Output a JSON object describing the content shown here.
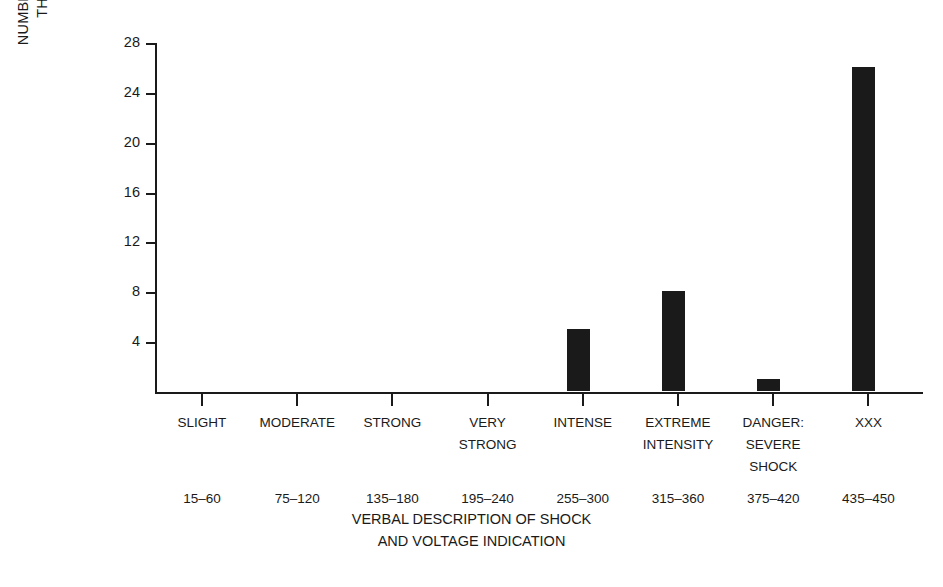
{
  "chart_data": {
    "type": "bar",
    "title": "",
    "xlabel": "VERBAL DESCRIPTION OF SHOCK AND VOLTAGE INDICATION",
    "xlabel_lines": [
      "VERBAL DESCRIPTION OF SHOCK",
      "AND VOLTAGE INDICATION"
    ],
    "ylabel": "NUMBER OF SUBJECTS FOR WHOM THIS WAS MAXIMUM SHOCK",
    "ylabel_lines": [
      "NUMBER OF SUBJECTS FOR WHOM",
      "THIS WAS MAXIMUM SHOCK"
    ],
    "categories": [
      "SLIGHT",
      "MODERATE",
      "STRONG",
      "VERY STRONG",
      "INTENSE",
      "EXTREME INTENSITY",
      "DANGER: SEVERE SHOCK",
      "XXX"
    ],
    "category_lines": [
      [
        "SLIGHT"
      ],
      [
        "MODERATE"
      ],
      [
        "STRONG"
      ],
      [
        "VERY",
        "STRONG"
      ],
      [
        "INTENSE"
      ],
      [
        "EXTREME",
        "INTENSITY"
      ],
      [
        "DANGER:",
        "SEVERE",
        "SHOCK"
      ],
      [
        "XXX"
      ]
    ],
    "voltage_labels": [
      "15–60",
      "75–120",
      "135–180",
      "195–240",
      "255–300",
      "315–360",
      "375–420",
      "435–450"
    ],
    "values": [
      0,
      0,
      0,
      0,
      5,
      8,
      1,
      26
    ],
    "ylim": [
      0,
      28
    ],
    "yticks": [
      4,
      8,
      12,
      16,
      20,
      24,
      28
    ],
    "ytick_labels": [
      "4",
      "8",
      "12",
      "16",
      "20",
      "24",
      "28"
    ],
    "grid": false,
    "legend": "none",
    "bar_color": "#1a1a1a",
    "axis_color": "#1a1a1a",
    "background_color": "#ffffff"
  }
}
